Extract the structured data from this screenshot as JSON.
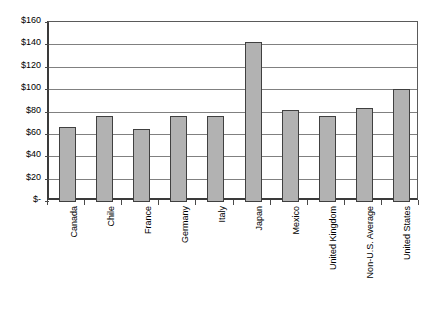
{
  "chart_data": {
    "type": "bar",
    "title": "",
    "subtitle": "",
    "xlabel": "",
    "ylabel": "",
    "categories": [
      "Canada",
      "Chile",
      "France",
      "Germany",
      "Italy",
      "Japan",
      "Mexico",
      "United Kingdom",
      "Non-U.S. Average",
      "United States"
    ],
    "values": [
      66,
      76,
      64,
      76,
      76,
      142,
      81,
      76,
      83,
      100
    ],
    "ylim": [
      0,
      160
    ],
    "ytick_values": [
      0,
      20,
      40,
      60,
      80,
      100,
      120,
      140,
      160
    ],
    "ytick_labels": [
      "$-",
      "$20",
      "$40",
      "$60",
      "$80",
      "$100",
      "$120",
      "$140",
      "$160"
    ],
    "grid": true,
    "grid_axis": "y",
    "legend": false,
    "legend_position": "none",
    "series": [
      {
        "name": "",
        "values": [
          66,
          76,
          64,
          76,
          76,
          142,
          81,
          76,
          83,
          100
        ]
      }
    ],
    "colors": {
      "bar_fill": "#b2b2b2",
      "bar_border": "#404040",
      "gridline": "#808080",
      "axis": "#3a3a3a",
      "background": "#ffffff",
      "text": "#000000"
    }
  }
}
